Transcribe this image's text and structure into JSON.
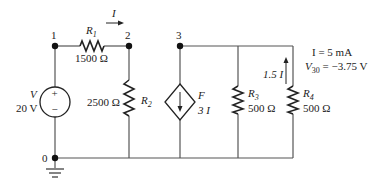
{
  "circuit": {
    "nodes": [
      {
        "id": "1",
        "label": "1"
      },
      {
        "id": "2",
        "label": "2"
      },
      {
        "id": "3",
        "label": "3"
      },
      {
        "id": "0",
        "label": "0"
      }
    ],
    "components": {
      "R1": {
        "name": "R",
        "sub": "1",
        "value": "1500 Ω"
      },
      "R2": {
        "name": "R",
        "sub": "2",
        "value": "2500 Ω"
      },
      "R3": {
        "name": "R",
        "sub": "3",
        "value": "500 Ω"
      },
      "R4": {
        "name": "R",
        "sub": "4",
        "value": "500 Ω"
      },
      "V": {
        "name": "V",
        "value": "20 V",
        "plus": "+",
        "minus": "−"
      },
      "F": {
        "name": "F",
        "value": "3 I"
      }
    },
    "current_label": "I",
    "r4_current_label": "1.5 I",
    "given": {
      "line1": "I = 5 mA",
      "line2_prefix": "V",
      "line2_sub": "30",
      "line2_value": " = −3.75 V"
    }
  }
}
